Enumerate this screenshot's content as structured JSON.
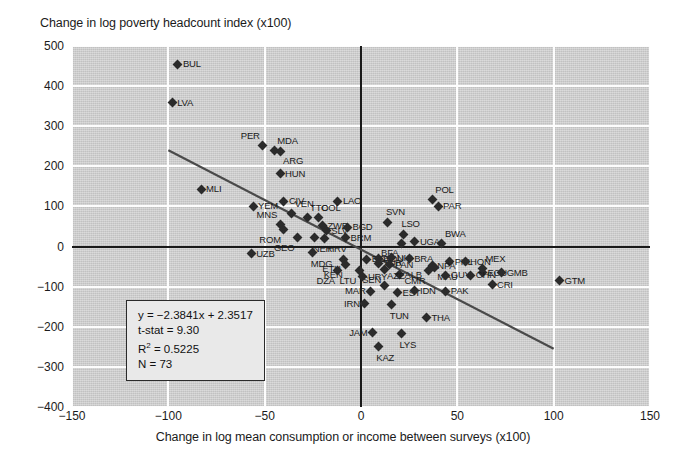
{
  "chart_data": {
    "type": "scatter",
    "title": "",
    "ylabel": "Change in log poverty headcount index (x100)",
    "xlabel": "Change in log mean consumption or income between surveys (x100)",
    "xlim": [
      -150,
      150
    ],
    "ylim": [
      -400,
      500
    ],
    "xticks": [
      "-150",
      "-100",
      "-50",
      "0",
      "50",
      "100",
      "150"
    ],
    "yticks": [
      "500",
      "400",
      "300",
      "200",
      "100",
      "0",
      "-100",
      "-200",
      "-300",
      "-400"
    ],
    "grid": true,
    "legend": "none",
    "annotations": {
      "equation": "y = −2.3841x + 2.3517",
      "tstat": "t-stat = 9.30",
      "r2_label": "R",
      "r2_sup": "2",
      "r2_value": " = 0.5225",
      "n": "N = 73"
    },
    "trendline": {
      "slope": -2.3841,
      "intercept": 2.3517,
      "x_start": -100,
      "y_start": 240,
      "x_end": 100,
      "y_end": -255
    },
    "points": [
      {
        "label": "BUL",
        "x": -95,
        "y": 455,
        "pos": "r"
      },
      {
        "label": "LVA",
        "x": -98,
        "y": 358,
        "pos": "r"
      },
      {
        "label": "PER",
        "x": -51,
        "y": 253,
        "pos": "tl"
      },
      {
        "label": "MDA",
        "x": -45,
        "y": 240,
        "pos": "tr"
      },
      {
        "label": "ARG",
        "x": -42,
        "y": 237,
        "pos": "br"
      },
      {
        "label": "HUN",
        "x": -42,
        "y": 182,
        "pos": "r"
      },
      {
        "label": "MLI",
        "x": -83,
        "y": 143,
        "pos": "r"
      },
      {
        "label": "CIV",
        "x": -40,
        "y": 113,
        "pos": "r"
      },
      {
        "label": "YEM",
        "x": -56,
        "y": 100,
        "pos": "r"
      },
      {
        "label": "LAO",
        "x": -12,
        "y": 113,
        "pos": "r"
      },
      {
        "label": "POL",
        "x": 37,
        "y": 118,
        "pos": "tr"
      },
      {
        "label": "PAR",
        "x": 40,
        "y": 100,
        "pos": "r"
      },
      {
        "label": "VEN",
        "x": -36,
        "y": 82,
        "pos": "tr"
      },
      {
        "label": "TTO",
        "x": -28,
        "y": 72,
        "pos": "tr"
      },
      {
        "label": "COL",
        "x": -22,
        "y": 72,
        "pos": "tr"
      },
      {
        "label": "MNS",
        "x": -42,
        "y": 55,
        "pos": "tl"
      },
      {
        "label": "ROM",
        "x": -40,
        "y": 42,
        "pos": "bl"
      },
      {
        "label": "ZWE",
        "x": -20,
        "y": 52,
        "pos": "r"
      },
      {
        "label": "SLV",
        "x": -18,
        "y": 40,
        "pos": "r"
      },
      {
        "label": "BGD",
        "x": -7,
        "y": 48,
        "pos": "r"
      },
      {
        "label": "SVN",
        "x": 14,
        "y": 60,
        "pos": "t"
      },
      {
        "label": "GEO",
        "x": -33,
        "y": 22,
        "pos": "bl"
      },
      {
        "label": "NER",
        "x": -24,
        "y": 22,
        "pos": "b"
      },
      {
        "label": "HRV",
        "x": -19,
        "y": 20,
        "pos": "br"
      },
      {
        "label": "BRM",
        "x": -8,
        "y": 22,
        "pos": "r"
      },
      {
        "label": "LSO",
        "x": 22,
        "y": 30,
        "pos": "t"
      },
      {
        "label": "UGA",
        "x": 28,
        "y": 12,
        "pos": "r"
      },
      {
        "label": "BFA",
        "x": 21,
        "y": 8,
        "pos": "bl"
      },
      {
        "label": "BWA",
        "x": 42,
        "y": 8,
        "pos": "tr"
      },
      {
        "label": "UZB",
        "x": -57,
        "y": -18,
        "pos": "r"
      },
      {
        "label": "MDG",
        "x": -25,
        "y": -15,
        "pos": "b"
      },
      {
        "label": "ETH",
        "x": -9,
        "y": -32,
        "pos": "bl"
      },
      {
        "label": "KEN",
        "x": -8,
        "y": -45,
        "pos": "bl"
      },
      {
        "label": "EGY",
        "x": 3,
        "y": -32,
        "pos": "r"
      },
      {
        "label": "ROU",
        "x": 9,
        "y": -30,
        "pos": "r"
      },
      {
        "label": "NIC",
        "x": 16,
        "y": -28,
        "pos": "r"
      },
      {
        "label": "BRA",
        "x": 25,
        "y": -30,
        "pos": "r"
      },
      {
        "label": "TUR",
        "x": 9,
        "y": -42,
        "pos": "r"
      },
      {
        "label": "PAN",
        "x": 15,
        "y": -45,
        "pos": "r"
      },
      {
        "label": "PHL",
        "x": 46,
        "y": -38,
        "pos": "r"
      },
      {
        "label": "HON",
        "x": 54,
        "y": -38,
        "pos": "r"
      },
      {
        "label": "NPA",
        "x": 37,
        "y": -48,
        "pos": "r"
      },
      {
        "label": "MAU",
        "x": 38,
        "y": -52,
        "pos": "br"
      },
      {
        "label": "MEX",
        "x": 63,
        "y": -55,
        "pos": "tr"
      },
      {
        "label": "ECU",
        "x": 63,
        "y": -65,
        "pos": "r"
      },
      {
        "label": "GMB",
        "x": 73,
        "y": -65,
        "pos": "r"
      },
      {
        "label": "DZA",
        "x": -12,
        "y": -60,
        "pos": "bl"
      },
      {
        "label": "LTU",
        "x": -1,
        "y": -60,
        "pos": "bl"
      },
      {
        "label": "SEN",
        "x": 12,
        "y": -58,
        "pos": "bl"
      },
      {
        "label": "CMR",
        "x": 35,
        "y": -60,
        "pos": "bl"
      },
      {
        "label": "GUY",
        "x": 44,
        "y": -72,
        "pos": "r"
      },
      {
        "label": "CHN",
        "x": 57,
        "y": -72,
        "pos": "r"
      },
      {
        "label": "URY",
        "x": 1,
        "y": -75,
        "pos": "r"
      },
      {
        "label": "ALB",
        "x": 20,
        "y": -70,
        "pos": "r"
      },
      {
        "label": "GTM",
        "x": 103,
        "y": -85,
        "pos": "r"
      },
      {
        "label": "CRI",
        "x": 68,
        "y": -95,
        "pos": "r"
      },
      {
        "label": "AZE",
        "x": 12,
        "y": -98,
        "pos": "tr"
      },
      {
        "label": "MAR",
        "x": 5,
        "y": -112,
        "pos": "l"
      },
      {
        "label": "EST",
        "x": 19,
        "y": -115,
        "pos": "r"
      },
      {
        "label": "IDN",
        "x": 28,
        "y": -110,
        "pos": "r"
      },
      {
        "label": "PAK",
        "x": 44,
        "y": -112,
        "pos": "r"
      },
      {
        "label": "IRN",
        "x": 2,
        "y": -142,
        "pos": "l"
      },
      {
        "label": "TUN",
        "x": 16,
        "y": -145,
        "pos": "b"
      },
      {
        "label": "THA",
        "x": 34,
        "y": -178,
        "pos": "r"
      },
      {
        "label": "JAM",
        "x": 6,
        "y": -215,
        "pos": "l"
      },
      {
        "label": "LYS",
        "x": 21,
        "y": -218,
        "pos": "b"
      },
      {
        "label": "KAZ",
        "x": 9,
        "y": -250,
        "pos": "b"
      }
    ]
  }
}
